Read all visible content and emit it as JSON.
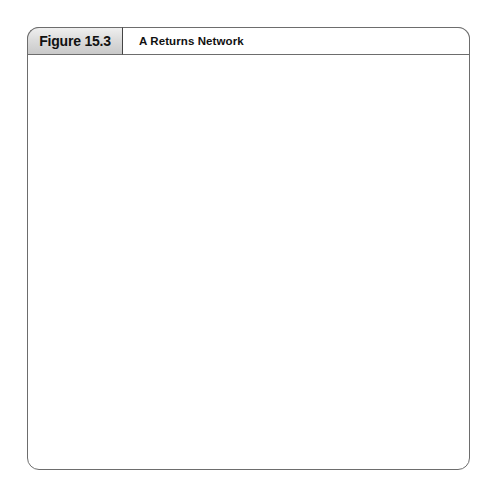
{
  "figure": {
    "number": "Figure 15.3",
    "title": "A Returns Network"
  },
  "labels": {
    "retailers": "Retailers",
    "disposal_markets": "Disposal Markets",
    "reuse_markets": "Reuse Markets",
    "recovery_line1": "Recovery",
    "recovery_line2": "Facilities"
  },
  "colors": {
    "outline": "#555555",
    "frame": "#6d6d6d",
    "tab_gray": "#dcdcdc",
    "truck_body": "#4a4a4a",
    "truck_cab": "#d0d0d0",
    "truck_wheel": "#111111",
    "background": "#ffffff",
    "arrow": "#333333"
  },
  "diagram": {
    "type": "network-flow",
    "node_radius": 11,
    "retailer_nodes": [
      {
        "id": "r1",
        "x": 207,
        "y": 126
      },
      {
        "id": "r2",
        "x": 237,
        "y": 126
      },
      {
        "id": "r3",
        "x": 267,
        "y": 126
      },
      {
        "id": "r4",
        "x": 297,
        "y": 126
      }
    ],
    "disposal_nodes": [
      {
        "id": "d1",
        "x": 97,
        "y": 288
      },
      {
        "id": "d2",
        "x": 97,
        "y": 313
      },
      {
        "id": "d3",
        "x": 97,
        "y": 347
      },
      {
        "id": "d4",
        "x": 97,
        "y": 385
      },
      {
        "id": "d5",
        "x": 97,
        "y": 420
      }
    ],
    "reuse_nodes": [
      {
        "id": "u1",
        "x": 398,
        "y": 291
      },
      {
        "id": "u2",
        "x": 398,
        "y": 322
      },
      {
        "id": "u3",
        "x": 398,
        "y": 364
      },
      {
        "id": "u4",
        "x": 398,
        "y": 396
      },
      {
        "id": "u5",
        "x": 398,
        "y": 428
      }
    ],
    "recovery_nodes": [
      {
        "id": "f1",
        "x": 230,
        "y": 336
      },
      {
        "id": "f2",
        "x": 264,
        "y": 334
      },
      {
        "id": "f3",
        "x": 281,
        "y": 349
      },
      {
        "id": "f4",
        "x": 219,
        "y": 365
      },
      {
        "id": "f5",
        "x": 247,
        "y": 368
      },
      {
        "id": "f6",
        "x": 272,
        "y": 380
      },
      {
        "id": "f7",
        "x": 220,
        "y": 391
      }
    ],
    "trucks": [
      {
        "id": "t-top-left",
        "x": 195,
        "y": 177,
        "facing": "left"
      },
      {
        "id": "t-top-right",
        "x": 245,
        "y": 177,
        "facing": "left"
      },
      {
        "id": "t-mid-left-upper",
        "x": 160,
        "y": 338,
        "facing": "left"
      },
      {
        "id": "t-mid-left-lower",
        "x": 163,
        "y": 365,
        "facing": "left"
      },
      {
        "id": "t-mid-right-upper",
        "x": 298,
        "y": 320,
        "facing": "right"
      },
      {
        "id": "t-mid-right-lower",
        "x": 298,
        "y": 350,
        "facing": "right"
      }
    ],
    "edges_retailer_to_recovery": [
      {
        "from": [
          207,
          137
        ],
        "to": [
          228,
          262
        ]
      },
      {
        "from": [
          237,
          137
        ],
        "to": [
          244,
          262
        ]
      },
      {
        "from": [
          267,
          137
        ],
        "to": [
          258,
          262
        ]
      },
      {
        "from": [
          297,
          137
        ],
        "to": [
          272,
          262
        ]
      }
    ],
    "edges_recovery_to_disposal": [
      {
        "from": [
          228,
          330
        ],
        "to": [
          109,
          290
        ]
      },
      {
        "from": [
          228,
          332
        ],
        "to": [
          109,
          314
        ]
      },
      {
        "from": [
          240,
          344
        ],
        "to": [
          109,
          347
        ]
      },
      {
        "from": [
          264,
          360
        ],
        "to": [
          109,
          384
        ]
      },
      {
        "from": [
          210,
          374
        ],
        "to": [
          109,
          386
        ]
      },
      {
        "from": [
          237,
          378
        ],
        "to": [
          108,
          419
        ]
      },
      {
        "from": [
          272,
          370
        ],
        "to": [
          109,
          421
        ]
      }
    ],
    "edges_recovery_to_reuse": [
      {
        "from": [
          281,
          342
        ],
        "to": [
          387,
          290
        ]
      },
      {
        "from": [
          262,
          340
        ],
        "to": [
          387,
          294
        ]
      },
      {
        "from": [
          279,
          356
        ],
        "to": [
          387,
          320
        ]
      },
      {
        "from": [
          265,
          372
        ],
        "to": [
          387,
          325
        ]
      },
      {
        "from": [
          277,
          381
        ],
        "to": [
          387,
          364
        ]
      },
      {
        "from": [
          281,
          386
        ],
        "to": [
          387,
          396
        ]
      },
      {
        "from": [
          274,
          390
        ],
        "to": [
          387,
          428
        ]
      }
    ],
    "edges_internal": [
      {
        "from": [
          230,
          336
        ],
        "to": [
          264,
          334
        ]
      },
      {
        "from": [
          230,
          336
        ],
        "to": [
          247,
          368
        ]
      },
      {
        "from": [
          264,
          334
        ],
        "to": [
          281,
          349
        ]
      },
      {
        "from": [
          247,
          368
        ],
        "to": [
          281,
          349
        ]
      },
      {
        "from": [
          219,
          365
        ],
        "to": [
          247,
          368
        ]
      },
      {
        "from": [
          220,
          391
        ],
        "to": [
          247,
          368
        ]
      },
      {
        "from": [
          247,
          368
        ],
        "to": [
          272,
          380
        ]
      },
      {
        "from": [
          281,
          349
        ],
        "to": [
          272,
          380
        ]
      }
    ]
  }
}
